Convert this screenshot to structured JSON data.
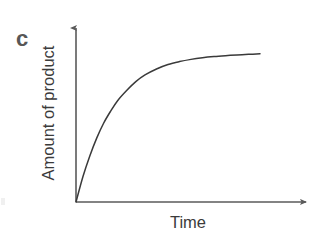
{
  "figure": {
    "panel_label": "c",
    "background_color": "#ffffff",
    "line_color": "#3a3a3a",
    "axis_color": "#5a5a5a",
    "text_color": "#3b3b3b",
    "panel_label_color": "#575757"
  },
  "axes": {
    "y_label": "Amount of product",
    "x_label": "Time",
    "y_axis_name": "y-axis-arrow",
    "x_axis_name": "x-axis-arrow",
    "tick_labels": [],
    "gridlines": false,
    "arrowheads": true
  },
  "chart_data": {
    "type": "line",
    "title": "",
    "subtitle": "",
    "xlabel": "Time",
    "ylabel": "Amount of product",
    "xlim": [
      0,
      1
    ],
    "ylim": [
      0,
      1.05
    ],
    "grid": false,
    "legend_position": "none",
    "annotations": [
      {
        "text": "c",
        "role": "panel-label",
        "position": "top-left"
      }
    ],
    "series": [
      {
        "name": "Amount of product",
        "color": "#3a3a3a",
        "x": [
          0.0,
          0.03,
          0.06,
          0.09,
          0.12,
          0.15,
          0.18,
          0.22,
          0.26,
          0.3,
          0.35,
          0.4,
          0.45,
          0.5,
          0.55,
          0.6,
          0.65,
          0.7,
          0.75,
          0.8
        ],
        "y": [
          0.0,
          0.17,
          0.31,
          0.43,
          0.53,
          0.61,
          0.68,
          0.75,
          0.81,
          0.855,
          0.895,
          0.925,
          0.945,
          0.96,
          0.971,
          0.979,
          0.985,
          0.99,
          0.994,
          0.997
        ]
      }
    ]
  }
}
